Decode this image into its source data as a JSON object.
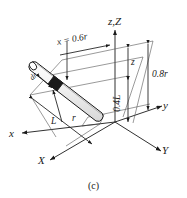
{
  "figure": {
    "caption": "(c)",
    "axes": [
      {
        "name": "z,Z",
        "label": "z,Z"
      },
      {
        "name": "x",
        "label": "x"
      },
      {
        "name": "X",
        "label": "X"
      },
      {
        "name": "y",
        "label": "y"
      },
      {
        "name": "Y",
        "label": "Y"
      }
    ],
    "dimensions": [
      {
        "name": "x-position",
        "label": "x = 0.6r"
      },
      {
        "name": "height-z",
        "label": "z"
      },
      {
        "name": "height-08r",
        "label": "0.8r"
      },
      {
        "name": "height-04L",
        "label": "0.4L"
      },
      {
        "name": "length-L",
        "label": "L"
      },
      {
        "name": "radius-r",
        "label": "r"
      },
      {
        "name": "element-dr",
        "label": "dr"
      }
    ],
    "colors": {
      "line": "#1a1a1a",
      "rod_fill": "#f2f2f2",
      "element_fill": "#1a1a1a",
      "background": "#ffffff"
    }
  }
}
